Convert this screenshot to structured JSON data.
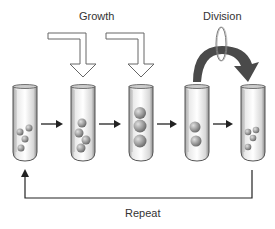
{
  "labels": {
    "growth": "Growth",
    "division": "Division",
    "repeat": "Repeat"
  },
  "tubes": [
    {
      "id": "tube-1",
      "stage": "initial",
      "cells": 4
    },
    {
      "id": "tube-2",
      "stage": "growing",
      "cells": 4
    },
    {
      "id": "tube-3",
      "stage": "grown",
      "cells": 3
    },
    {
      "id": "tube-4",
      "stage": "dividing",
      "cells": 2
    },
    {
      "id": "tube-5",
      "stage": "divided",
      "cells": 4
    }
  ],
  "colors": {
    "arrow": "#222222",
    "division_arrow": "#555555",
    "tube_outline": "#666666",
    "cell": "#888888"
  }
}
